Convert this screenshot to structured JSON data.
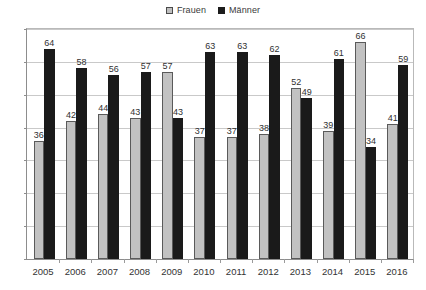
{
  "legend": {
    "position": "top-center",
    "entries": [
      {
        "label": "Frauen",
        "swatch": "frauen-swatch",
        "color": "#c2c2c2"
      },
      {
        "label": "Männer",
        "swatch": "maenner-swatch",
        "color": "#1a1a1a"
      }
    ]
  },
  "axis": {
    "y_ticks": [
      "0",
      "10",
      "20",
      "30",
      "40",
      "50",
      "60",
      "70"
    ],
    "x_ticks": [
      "2005",
      "2006",
      "2007",
      "2008",
      "2009",
      "2010",
      "2011",
      "2012",
      "2013",
      "2014",
      "2015",
      "2016"
    ]
  },
  "chart_data": {
    "type": "bar",
    "title": "",
    "xlabel": "",
    "ylabel": "",
    "ylim": [
      0,
      70
    ],
    "ytick_step": 10,
    "grid": true,
    "legend_position": "top-center",
    "categories": [
      "2005",
      "2006",
      "2007",
      "2008",
      "2009",
      "2010",
      "2011",
      "2012",
      "2013",
      "2014",
      "2015",
      "2016"
    ],
    "series": [
      {
        "name": "Frauen",
        "color": "#c2c2c2",
        "values": [
          36,
          42,
          44,
          43,
          57,
          37,
          37,
          38,
          52,
          39,
          66,
          41
        ]
      },
      {
        "name": "Männer",
        "color": "#1a1a1a",
        "values": [
          64,
          58,
          56,
          57,
          43,
          63,
          63,
          62,
          49,
          61,
          34,
          59
        ]
      }
    ]
  }
}
